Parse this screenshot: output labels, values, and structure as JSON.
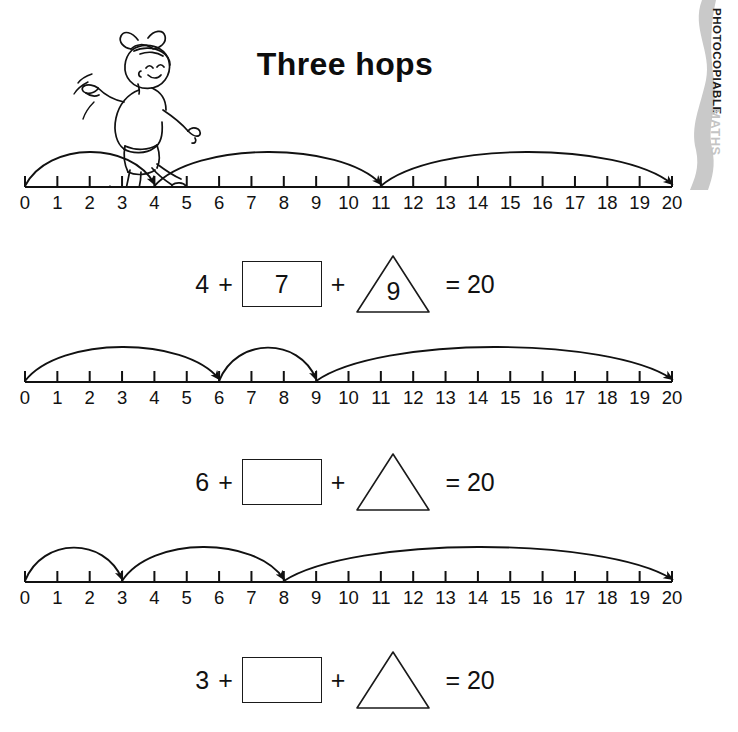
{
  "page": {
    "title": "Three hops",
    "side_tab": {
      "photocopiable": "PHOTOCOPIABLE",
      "subject": "MATHS"
    },
    "illustration": "hopping-girl-illustration",
    "ink_color": "#111111",
    "gray_color": "#c4c4c4",
    "ribbon_color": "#bfbfbf"
  },
  "numberline": {
    "min": 0,
    "max": 20,
    "ticks": [
      "0",
      "1",
      "2",
      "3",
      "4",
      "5",
      "6",
      "7",
      "8",
      "9",
      "10",
      "11",
      "12",
      "13",
      "14",
      "15",
      "16",
      "17",
      "18",
      "19",
      "20"
    ]
  },
  "exercises": [
    {
      "id": "exercise-1",
      "hops": [
        {
          "from": 0,
          "to": 4
        },
        {
          "from": 4,
          "to": 11
        },
        {
          "from": 11,
          "to": 20
        }
      ],
      "equation": {
        "first": "4",
        "plus1": "+",
        "box_value": "7",
        "plus2": "+",
        "triangle_value": "9",
        "equals": "= 20"
      }
    },
    {
      "id": "exercise-2",
      "hops": [
        {
          "from": 0,
          "to": 6
        },
        {
          "from": 6,
          "to": 9
        },
        {
          "from": 9,
          "to": 20
        }
      ],
      "equation": {
        "first": "6",
        "plus1": "+",
        "box_value": "",
        "plus2": "+",
        "triangle_value": "",
        "equals": "= 20"
      }
    },
    {
      "id": "exercise-3",
      "hops": [
        {
          "from": 0,
          "to": 3
        },
        {
          "from": 3,
          "to": 8
        },
        {
          "from": 8,
          "to": 20
        }
      ],
      "equation": {
        "first": "3",
        "plus1": "+",
        "box_value": "",
        "plus2": "+",
        "triangle_value": "",
        "equals": "= 20"
      }
    }
  ]
}
